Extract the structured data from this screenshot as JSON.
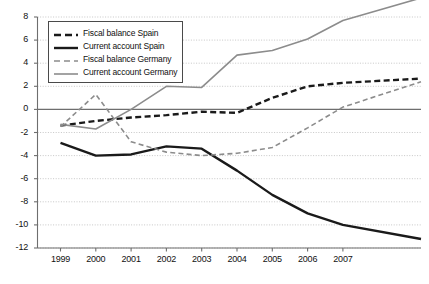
{
  "chart_data": {
    "type": "line",
    "title": "",
    "xlabel": "",
    "ylabel": "",
    "categories": [
      "1999",
      "2000",
      "2001",
      "2002",
      "2003",
      "2004",
      "2005",
      "2006",
      "2007"
    ],
    "x": [
      1999,
      2000,
      2001,
      2002,
      2003,
      2004,
      2005,
      2006,
      2007
    ],
    "ylim": [
      -12,
      8
    ],
    "ytick_step": 2,
    "yticks": [
      "8",
      "6",
      "4",
      "2",
      "0",
      "-2",
      "-4",
      "-6",
      "-8",
      "-10",
      "-12"
    ],
    "grid": true,
    "grid_axis": "y",
    "legend_position": "top-left",
    "zero_line": true,
    "series": [
      {
        "name": "Fiscal balance Spain",
        "color": "#1a1a1a",
        "style": "dashed",
        "width": 2.4,
        "values": [
          -1.4,
          -1.0,
          -0.7,
          -0.5,
          -0.2,
          -0.3,
          1.0,
          2.0,
          2.3
        ]
      },
      {
        "name": "Current account Spain",
        "color": "#1a1a1a",
        "style": "solid",
        "width": 2.4,
        "values": [
          -2.9,
          -4.0,
          -3.9,
          -3.2,
          -3.4,
          -5.3,
          -7.4,
          -9.0,
          -10.0
        ]
      },
      {
        "name": "Fiscal balance Germany",
        "color": "#8c8c8c",
        "style": "dashed",
        "width": 1.6,
        "values": [
          -1.5,
          1.3,
          -2.8,
          -3.7,
          -4.0,
          -3.8,
          -3.3,
          -1.6,
          0.2
        ]
      },
      {
        "name": "Current account Germany",
        "color": "#8c8c8c",
        "style": "solid",
        "width": 1.6,
        "values": [
          -1.3,
          -1.7,
          0.0,
          2.0,
          1.9,
          4.7,
          5.1,
          6.1,
          7.7
        ]
      }
    ]
  },
  "legend": {
    "items": [
      {
        "label": "Fiscal balance Spain"
      },
      {
        "label": "Current account Spain"
      },
      {
        "label": "Fiscal balance Germany"
      },
      {
        "label": "Current account Germany"
      }
    ]
  },
  "axis_colors": {
    "axis_line": "#6e6e6e",
    "grid_line": "#b9b9b9",
    "zero_line": "#6e6e6e"
  }
}
